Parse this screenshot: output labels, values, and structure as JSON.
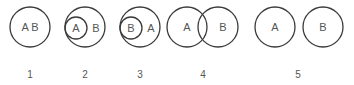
{
  "diagrams": [
    {
      "number": "1",
      "labels": [
        "A B"
      ],
      "relation": "equal"
    },
    {
      "number": "2",
      "labels": [
        "A",
        "B"
      ],
      "relation": "A subset of B"
    },
    {
      "number": "3",
      "labels": [
        "B",
        "A"
      ],
      "relation": "B subset of A"
    },
    {
      "number": "4",
      "labels": [
        "A",
        "B"
      ],
      "relation": "overlap"
    },
    {
      "number": "5",
      "labels": [
        "A",
        "B"
      ],
      "relation": "disjoint"
    }
  ],
  "colors": {
    "stroke": "#3a3a3a",
    "text": "#555555"
  }
}
